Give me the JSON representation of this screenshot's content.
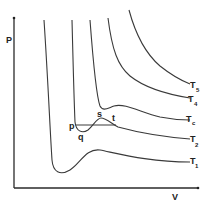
{
  "diagram": {
    "title": "",
    "axes": {
      "y_label": "P",
      "x_label": "V"
    },
    "isotherms": [
      {
        "name": "T5",
        "base": "T",
        "sub": "5"
      },
      {
        "name": "T4",
        "base": "T",
        "sub": "4"
      },
      {
        "name": "Tc",
        "base": "T",
        "sub": "c"
      },
      {
        "name": "T2",
        "base": "T",
        "sub": "2"
      },
      {
        "name": "T1",
        "base": "T",
        "sub": "1"
      }
    ],
    "points": {
      "p": "p",
      "q": "q",
      "s": "s",
      "t": "t"
    },
    "colors": {
      "stroke": "#3a3a3a",
      "background": "#ffffff"
    }
  }
}
